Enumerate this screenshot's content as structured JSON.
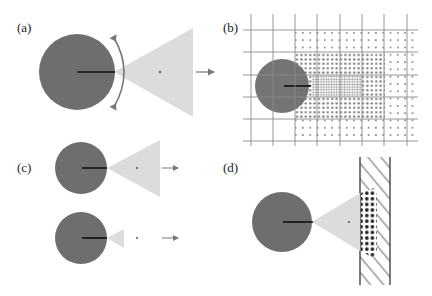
{
  "figure": {
    "colors": {
      "disk": "#6e6e6e",
      "cone": "#dcdcdc",
      "grid": "#8a8a8a",
      "line": "#111111",
      "arrow": "#777777",
      "dot": "#555555",
      "wall": "#444444",
      "hatch": "#999999"
    },
    "panels": [
      {
        "id": "a",
        "label": "(a)",
        "description": "Disk with radius line, rotating arc arrow, wide cone and a forward arrow"
      },
      {
        "id": "b",
        "label": "(b)",
        "description": "Disk on a grid with dotted sampling regions of varying density"
      },
      {
        "id": "c",
        "label": "(c)",
        "description": "Two disks: one with a wide cone, one with a narrow cone, each with forward arrow"
      },
      {
        "id": "d",
        "label": "(d)",
        "description": "Disk with cone hitting a hatched wall with dense dot region"
      }
    ]
  }
}
